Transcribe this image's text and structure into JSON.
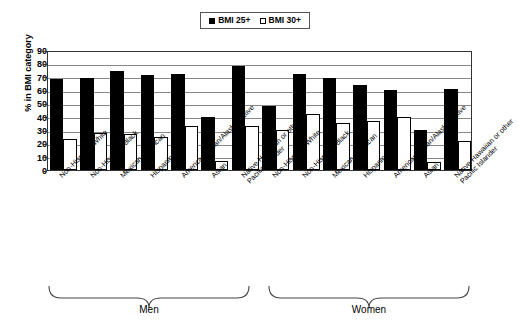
{
  "chart_data": {
    "type": "bar",
    "title": "",
    "xlabel": "",
    "ylabel": "% in BMI category",
    "ylim": [
      0,
      90
    ],
    "yticks": [
      0,
      10,
      20,
      30,
      40,
      50,
      60,
      70,
      80,
      90
    ],
    "grid": true,
    "legend_position": "top-center",
    "legend": [
      "BMI 25+",
      "BMI 30+"
    ],
    "groups": [
      "Men",
      "Women"
    ],
    "categories": [
      "Non-Hispanic White",
      "Non-Hispanic Black",
      "Mexican American",
      "Hispanic",
      "American Indian/Alaska Native",
      "Asian",
      "Native Hawaiian or other Pacific Islander"
    ],
    "series": [
      {
        "name": "BMI 25+",
        "color": "#000000",
        "men": [
          68,
          69,
          74,
          71,
          72,
          40,
          78
        ],
        "women": [
          48,
          72,
          69,
          64,
          60,
          30,
          61
        ]
      },
      {
        "name": "BMI 30+",
        "color": "#ffffff",
        "men": [
          23,
          28,
          27,
          25,
          33,
          7,
          33
        ],
        "women": [
          30,
          42,
          35,
          37,
          40,
          6,
          22
        ]
      }
    ]
  },
  "legend": {
    "items": [
      {
        "label": "BMI 25+",
        "style": "filled"
      },
      {
        "label": "BMI 30+",
        "style": "hollow"
      }
    ]
  },
  "axes": {
    "y_title": "% in BMI category",
    "y_ticks": [
      "90",
      "80",
      "70",
      "60",
      "50",
      "40",
      "30",
      "20",
      "10",
      "0"
    ]
  },
  "x_categories": [
    {
      "line1": "Non-Hispanic White",
      "line2": ""
    },
    {
      "line1": "Non-Hispanic Black",
      "line2": ""
    },
    {
      "line1": "Mexican American",
      "line2": ""
    },
    {
      "line1": "Hispanic",
      "line2": ""
    },
    {
      "line1": "American Indian/Alaska Native",
      "line2": ""
    },
    {
      "line1": "Asian",
      "line2": ""
    },
    {
      "line1": "Native Hawaiian or other",
      "line2": "Pacific Islander"
    }
  ],
  "group_brackets": [
    {
      "label": "Men"
    },
    {
      "label": "Women"
    }
  ]
}
